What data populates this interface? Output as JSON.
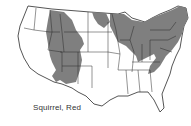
{
  "map": {
    "title": "Squirrel, Red",
    "subject": "Red squirrel range in the contiguous United States",
    "colors": {
      "range_fill": "#7f7f7f",
      "land_fill": "#ffffff",
      "border": "#2a2a2a"
    },
    "range_regions": [
      "Northern Rockies (Montana, Idaho, Wyoming)",
      "Southern Rockies (Colorado, Utah, Arizona, New Mexico)",
      "Upper Midwest (North Dakota, Minnesota, Wisconsin, Michigan, Iowa)",
      "Great Lakes and Ohio Valley (Illinois, Indiana, Ohio)",
      "Northeast and Appalachians (New York, Pennsylvania, New England, Virginia, Tennessee)"
    ]
  }
}
